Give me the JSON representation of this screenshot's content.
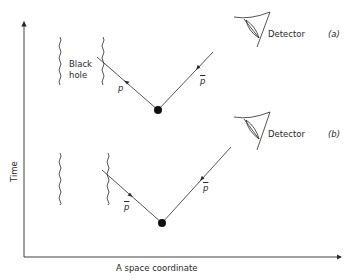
{
  "figure": {
    "axes": {
      "y_label": "Time",
      "x_label": "A space coordinate"
    },
    "panels": [
      {
        "id": "a",
        "panel_label": "(a)",
        "black_hole_label_line1": "Black",
        "black_hole_label_line2": "hole",
        "incoming_particle_label": "p",
        "outgoing_particle_label": "p",
        "outgoing_particle_bar": true,
        "incoming_particle_bar": false,
        "detector_label": "Detector"
      },
      {
        "id": "b",
        "panel_label": "(b)",
        "incoming_particle_label": "p",
        "outgoing_particle_label": "p",
        "outgoing_particle_bar": true,
        "incoming_particle_bar": true,
        "detector_label": "Detector"
      }
    ],
    "colors": {
      "ink": "#2a2a2a",
      "background": "#ffffff"
    }
  }
}
